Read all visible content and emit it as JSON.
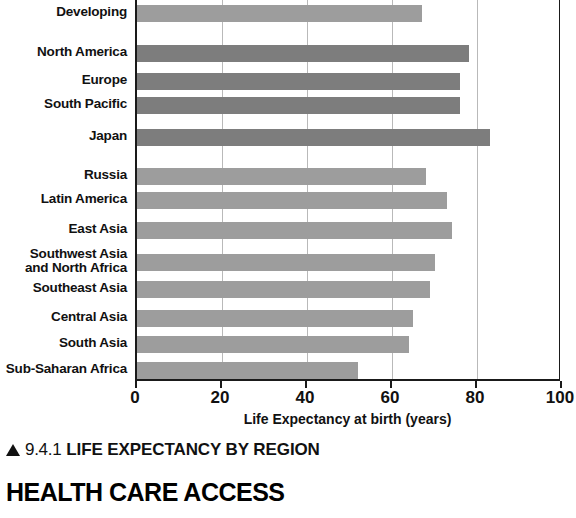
{
  "chart_data": {
    "type": "bar",
    "orientation": "horizontal",
    "title": "LIFE EXPECTANCY BY REGION",
    "xlabel": "Life Expectancy at birth (years)",
    "ylabel": "",
    "xlim": [
      0,
      100
    ],
    "xticks": [
      0,
      20,
      40,
      60,
      80,
      100
    ],
    "grid": true,
    "grid_axis": "x",
    "legend": false,
    "categories": [
      "Developing",
      "North America",
      "Europe",
      "South Pacific",
      "Japan",
      "Russia",
      "Latin America",
      "East Asia",
      "Southwest Asia\nand North Africa",
      "Southeast Asia",
      "Central Asia",
      "South Asia",
      "Sub-Saharan Africa"
    ],
    "values": [
      67,
      78,
      76,
      76,
      83,
      68,
      73,
      74,
      70,
      69,
      65,
      64,
      52
    ],
    "bar_shades": [
      "light",
      "dark",
      "dark",
      "dark",
      "dark",
      "light",
      "light",
      "light",
      "light",
      "light",
      "light",
      "light",
      "light"
    ],
    "colors": {
      "bar_light": "#9d9d9d",
      "bar_dark": "#7d7d7d",
      "axis": "#1a1a1a",
      "grid": "#b9b9b9"
    },
    "note_top_cropped": true
  },
  "axis": {
    "x_title": "Life Expectancy at birth (years)",
    "tick_labels": [
      "0",
      "20",
      "40",
      "60",
      "80",
      "100"
    ]
  },
  "caption": {
    "marker": "triangle-up-icon",
    "number": "9.4.1",
    "title": "LIFE EXPECTANCY BY REGION"
  },
  "section": {
    "heading": "HEALTH CARE ACCESS"
  }
}
